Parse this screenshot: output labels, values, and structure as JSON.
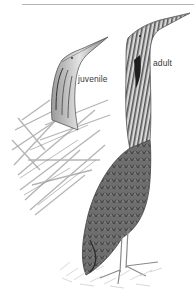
{
  "illustration": {
    "subject": "bittern illustration",
    "labels": {
      "juvenile": "juvenile",
      "adult": "adult"
    },
    "colors": {
      "background": "#ffffff",
      "rule": "#b4b4b4",
      "ink_dark": "#3c3c3c",
      "ink_mid": "#7a7a7a",
      "ink_light": "#c8c8c8"
    }
  }
}
